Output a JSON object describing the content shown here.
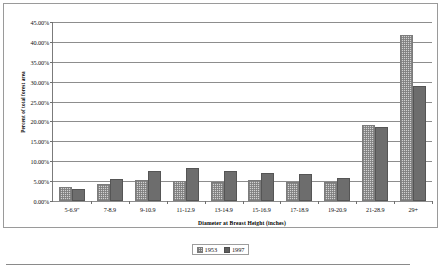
{
  "chart_data": {
    "type": "bar",
    "title": "",
    "xlabel": "Diameter at Breast Height (inches)",
    "ylabel": "Percent of total forest area",
    "categories": [
      "5-6.9\"",
      "7-8.9",
      "9-10.9",
      "11-12.9",
      "13-14.9",
      "15-16.9",
      "17-18.9",
      "19-20.9",
      "21-28.9",
      "29+"
    ],
    "series": [
      {
        "name": "1953",
        "values": [
          3.4,
          4.2,
          5.2,
          5.1,
          4.7,
          5.2,
          4.9,
          4.8,
          19.2,
          41.8
        ]
      },
      {
        "name": "1997",
        "values": [
          3.0,
          5.5,
          7.5,
          8.3,
          7.6,
          7.0,
          6.9,
          5.9,
          18.6,
          28.9
        ]
      }
    ],
    "ylim": [
      0,
      45
    ],
    "ytick_values": [
      0,
      5,
      10,
      15,
      20,
      25,
      30,
      35,
      40,
      45
    ],
    "ytick_labels": [
      "0.00%",
      "5.00%",
      "10.00%",
      "15.00%",
      "20.00%",
      "25.00%",
      "30.00%",
      "35.00%",
      "40.00%",
      "45.00%"
    ],
    "grid": true,
    "legend_position": "bottom",
    "colors": {
      "series_1953": "#d2d2d2",
      "series_1997": "#6d6d6d",
      "gridline": "#8d8d8d",
      "axis": "#7b7b7b",
      "frame": "#9a9a9a",
      "text": "#111111"
    }
  }
}
